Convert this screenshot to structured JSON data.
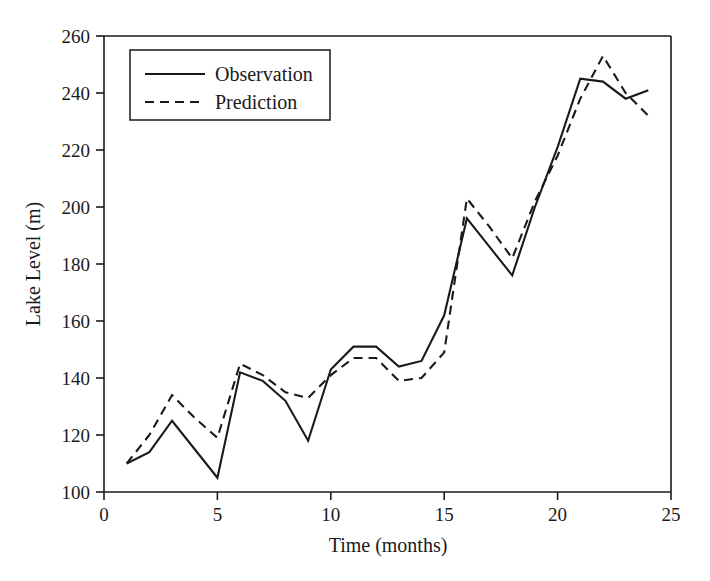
{
  "chart_data": {
    "type": "line",
    "title": "",
    "xlabel": "Time (months)",
    "ylabel": "Lake Level (m)",
    "xlim": [
      0,
      25
    ],
    "ylim": [
      100,
      260
    ],
    "xticks": [
      0,
      5,
      10,
      15,
      20,
      25
    ],
    "yticks": [
      100,
      120,
      140,
      160,
      180,
      200,
      220,
      240,
      260
    ],
    "grid": false,
    "legend_position": "top-left",
    "x": [
      1,
      2,
      3,
      4,
      5,
      6,
      7,
      8,
      9,
      10,
      11,
      12,
      13,
      14,
      15,
      16,
      17,
      18,
      19,
      20,
      21,
      22,
      23,
      24
    ],
    "series": [
      {
        "name": "Observation",
        "style": "solid",
        "color": "#1a1a1a",
        "values": [
          110,
          114,
          125,
          115,
          105,
          142,
          139,
          132,
          118,
          143,
          151,
          151,
          144,
          146,
          162,
          196,
          186,
          176,
          200,
          221,
          245,
          244,
          238,
          241
        ]
      },
      {
        "name": "Prediction",
        "style": "dashed",
        "color": "#1a1a1a",
        "values": [
          110,
          120,
          134,
          126,
          119,
          145,
          141,
          135,
          133,
          141,
          147,
          147,
          139,
          140,
          149,
          203,
          193,
          182,
          202,
          218,
          238,
          253,
          240,
          232
        ]
      }
    ]
  },
  "axes": {
    "x_tick_labels": [
      "0",
      "5",
      "10",
      "15",
      "20",
      "25"
    ],
    "y_tick_labels": [
      "100",
      "120",
      "140",
      "160",
      "180",
      "200",
      "220",
      "240",
      "260"
    ],
    "x_axis_title": "Time (months)",
    "y_axis_title": "Lake Level (m)"
  },
  "legend": {
    "entries": [
      {
        "label": "Observation",
        "style": "solid"
      },
      {
        "label": "Prediction",
        "style": "dashed"
      }
    ]
  }
}
